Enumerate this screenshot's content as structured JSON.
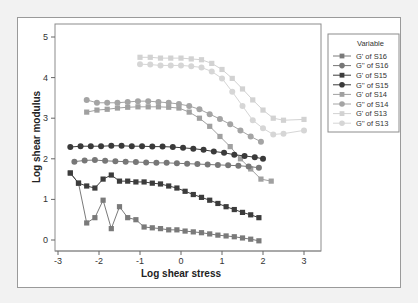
{
  "chart_data": {
    "type": "scatter",
    "title": "",
    "xlabel": "Log shear stress",
    "ylabel": "Log shear modulus",
    "xlim": [
      -3.1,
      3.3
    ],
    "ylim": [
      -0.25,
      5.1
    ],
    "xticks": [
      -3,
      -2,
      -1,
      0,
      1,
      2,
      3
    ],
    "yticks": [
      0,
      1,
      2,
      3,
      4,
      5
    ],
    "grid": false,
    "legend_position": "right",
    "legend_title": "Variable",
    "series": [
      {
        "name": "G' of S16",
        "marker": "square",
        "color": "#7a7a7a",
        "x": [
          -2.7,
          -2.5,
          -2.3,
          -2.1,
          -1.9,
          -1.7,
          -1.5,
          -1.3,
          -1.1,
          -0.9,
          -0.7,
          -0.5,
          -0.3,
          -0.1,
          0.1,
          0.3,
          0.5,
          0.7,
          0.9,
          1.1,
          1.3,
          1.5,
          1.7,
          1.9
        ],
        "y": [
          1.65,
          1.4,
          0.42,
          0.55,
          0.98,
          0.28,
          0.82,
          0.55,
          0.5,
          0.32,
          0.3,
          0.28,
          0.25,
          0.25,
          0.22,
          0.2,
          0.18,
          0.15,
          0.12,
          0.1,
          0.08,
          0.05,
          0.02,
          -0.02
        ]
      },
      {
        "name": "G'' of S16",
        "marker": "circle",
        "color": "#777777",
        "x": [
          -2.6,
          -2.35,
          -2.1,
          -1.85,
          -1.6,
          -1.35,
          -1.1,
          -0.85,
          -0.6,
          -0.35,
          -0.1,
          0.15,
          0.4,
          0.65,
          0.9,
          1.15,
          1.4,
          1.65,
          1.9
        ],
        "y": [
          1.93,
          1.96,
          1.97,
          1.95,
          1.94,
          1.93,
          1.92,
          1.91,
          1.9,
          1.9,
          1.89,
          1.88,
          1.87,
          1.86,
          1.85,
          1.84,
          1.83,
          1.81,
          1.78
        ]
      },
      {
        "name": "G' of S15",
        "marker": "square",
        "color": "#3c3c3c",
        "x": [
          -2.7,
          -2.5,
          -2.3,
          -2.1,
          -1.9,
          -1.7,
          -1.5,
          -1.3,
          -1.1,
          -0.9,
          -0.7,
          -0.5,
          -0.3,
          -0.1,
          0.1,
          0.3,
          0.5,
          0.7,
          0.9,
          1.1,
          1.3,
          1.5,
          1.7,
          1.9
        ],
        "y": [
          1.65,
          1.4,
          1.33,
          1.28,
          1.5,
          1.6,
          1.45,
          1.45,
          1.43,
          1.43,
          1.4,
          1.38,
          1.33,
          1.28,
          1.2,
          1.12,
          1.05,
          0.98,
          0.9,
          0.82,
          0.75,
          0.68,
          0.62,
          0.55
        ]
      },
      {
        "name": "G'' of S15",
        "marker": "circle",
        "color": "#3a3a3a",
        "x": [
          -2.7,
          -2.45,
          -2.2,
          -1.95,
          -1.7,
          -1.45,
          -1.2,
          -0.95,
          -0.7,
          -0.45,
          -0.2,
          0.05,
          0.3,
          0.55,
          0.8,
          1.05,
          1.3,
          1.55,
          1.8,
          2.0
        ],
        "y": [
          2.29,
          2.31,
          2.31,
          2.31,
          2.32,
          2.32,
          2.31,
          2.31,
          2.3,
          2.3,
          2.29,
          2.27,
          2.25,
          2.22,
          2.18,
          2.15,
          2.1,
          2.07,
          2.04,
          2.0
        ]
      },
      {
        "name": "G' of S14",
        "marker": "square",
        "color": "#a0a0a0",
        "x": [
          -2.3,
          -2.05,
          -1.8,
          -1.55,
          -1.3,
          -1.05,
          -0.8,
          -0.55,
          -0.3,
          -0.05,
          0.2,
          0.45,
          0.7,
          0.95,
          1.2,
          1.45,
          1.7,
          1.95,
          2.2
        ],
        "y": [
          3.15,
          3.2,
          3.22,
          3.25,
          3.27,
          3.28,
          3.28,
          3.28,
          3.27,
          3.25,
          3.15,
          3.0,
          2.8,
          2.55,
          2.3,
          2.0,
          1.75,
          1.5,
          1.45
        ]
      },
      {
        "name": "G'' of S14",
        "marker": "circle",
        "color": "#a4a4a4",
        "x": [
          -2.3,
          -2.05,
          -1.8,
          -1.55,
          -1.3,
          -1.05,
          -0.8,
          -0.55,
          -0.3,
          -0.05,
          0.2,
          0.45,
          0.7,
          0.95,
          1.2,
          1.45,
          1.7,
          1.95
        ],
        "y": [
          3.45,
          3.38,
          3.38,
          3.38,
          3.4,
          3.42,
          3.42,
          3.4,
          3.38,
          3.35,
          3.3,
          3.22,
          3.1,
          2.98,
          2.85,
          2.7,
          2.55,
          2.42
        ]
      },
      {
        "name": "G' of S13",
        "marker": "square",
        "color": "#d2d2d2",
        "x": [
          -1.0,
          -0.75,
          -0.5,
          -0.25,
          0.0,
          0.25,
          0.5,
          0.75,
          1.0,
          1.25,
          1.5,
          1.75,
          2.0,
          2.25,
          2.5,
          3.0
        ],
        "y": [
          4.5,
          4.5,
          4.48,
          4.48,
          4.48,
          4.46,
          4.44,
          4.35,
          4.2,
          3.98,
          3.72,
          3.45,
          3.2,
          3.0,
          2.95,
          2.97
        ]
      },
      {
        "name": "G'' of S13",
        "marker": "circle",
        "color": "#d6d6d6",
        "x": [
          -1.0,
          -0.75,
          -0.5,
          -0.25,
          0.0,
          0.25,
          0.5,
          0.75,
          1.0,
          1.25,
          1.5,
          1.75,
          2.0,
          2.25,
          2.5,
          3.0
        ],
        "y": [
          4.33,
          4.32,
          4.3,
          4.3,
          4.3,
          4.28,
          4.25,
          4.15,
          3.98,
          3.65,
          3.3,
          2.95,
          2.75,
          2.6,
          2.62,
          2.7
        ]
      }
    ]
  },
  "axes": {
    "x_title": "Log shear stress",
    "y_title": "Log shear modulus",
    "x_ticks": [
      "-3",
      "-2",
      "-1",
      "0",
      "1",
      "2",
      "3"
    ],
    "y_ticks": [
      "0",
      "1",
      "2",
      "3",
      "4",
      "5"
    ]
  },
  "legend": {
    "title": "Variable",
    "items": [
      {
        "label": "G' of S16",
        "marker": "square",
        "color": "#7a7a7a"
      },
      {
        "label": "G'' of S16",
        "marker": "circle",
        "color": "#777777"
      },
      {
        "label": "G' of S15",
        "marker": "square",
        "color": "#3c3c3c"
      },
      {
        "label": "G'' of S15",
        "marker": "circle",
        "color": "#3a3a3a"
      },
      {
        "label": "G' of S14",
        "marker": "square",
        "color": "#a0a0a0"
      },
      {
        "label": "G'' of S14",
        "marker": "circle",
        "color": "#a4a4a4"
      },
      {
        "label": "G' of S13",
        "marker": "square",
        "color": "#d2d2d2"
      },
      {
        "label": "G'' of S13",
        "marker": "circle",
        "color": "#d6d6d6"
      }
    ]
  }
}
